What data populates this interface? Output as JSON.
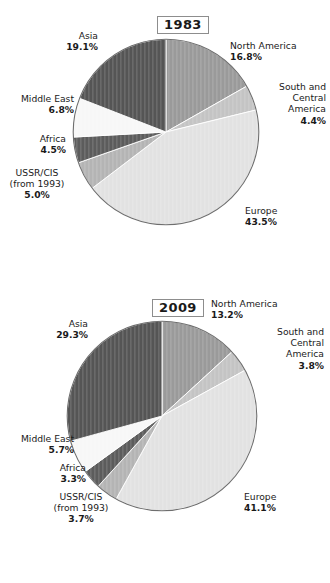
{
  "page": {
    "background": "#ffffff"
  },
  "charts": [
    {
      "id": "chart-1983",
      "year_label": "1983",
      "labels": {
        "north_america": {
          "name": "North America",
          "value": "16.8%"
        },
        "south_central_america": {
          "name": "South and\nCentral\nAmerica",
          "value": "4.4%"
        },
        "europe": {
          "name": "Europe",
          "value": "43.5%"
        },
        "ussr_cis": {
          "name": "USSR/CIS\n(from 1993)",
          "value": "5.0%"
        },
        "africa": {
          "name": "Africa",
          "value": "4.5%"
        },
        "middle_east": {
          "name": "Middle East",
          "value": "6.8%"
        },
        "asia": {
          "name": "Asia",
          "value": "19.1%"
        }
      }
    },
    {
      "id": "chart-2009",
      "year_label": "2009",
      "labels": {
        "north_america": {
          "name": "North America",
          "value": "13.2%"
        },
        "south_central_america": {
          "name": "South and\nCentral\nAmerica",
          "value": "3.8%"
        },
        "europe": {
          "name": "Europe",
          "value": "41.1%"
        },
        "ussr_cis": {
          "name": "USSR/CIS\n(from 1993)",
          "value": "3.7%"
        },
        "africa": {
          "name": "Africa",
          "value": "3.3%"
        },
        "middle_east": {
          "name": "Middle East",
          "value": "5.7%"
        },
        "asia": {
          "name": "Asia",
          "value": "29.3%"
        }
      }
    }
  ],
  "chart_data": [
    {
      "type": "pie",
      "title": "1983",
      "categories": [
        "North America",
        "South and Central America",
        "Europe",
        "USSR/CIS (from 1993)",
        "Africa",
        "Middle East",
        "Asia"
      ],
      "values": [
        16.8,
        4.4,
        43.5,
        5.0,
        4.5,
        6.8,
        19.1
      ],
      "unit": "%",
      "start_angle_deg": 0,
      "direction": "clockwise",
      "colors": [
        "#9a9a9a",
        "#c4c4c4",
        "#e2e2e2",
        "#b4b4b4",
        "#5c5c5c",
        "#f7f7f7",
        "#555555"
      ],
      "legend": "none",
      "labels_position": "outside-leader"
    },
    {
      "type": "pie",
      "title": "2009",
      "categories": [
        "North America",
        "South and Central America",
        "Europe",
        "USSR/CIS (from 1993)",
        "Africa",
        "Middle East",
        "Asia"
      ],
      "values": [
        13.2,
        3.8,
        41.1,
        3.7,
        3.3,
        5.7,
        29.3
      ],
      "unit": "%",
      "start_angle_deg": 0,
      "direction": "clockwise",
      "colors": [
        "#9a9a9a",
        "#c4c4c4",
        "#e2e2e2",
        "#b4b4b4",
        "#5c5c5c",
        "#f7f7f7",
        "#555555"
      ],
      "legend": "none",
      "labels_position": "outside-leader"
    }
  ]
}
